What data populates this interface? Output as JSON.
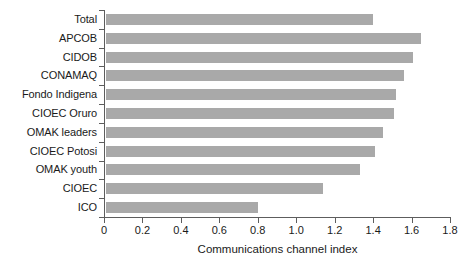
{
  "chart_data": {
    "type": "bar",
    "orientation": "horizontal",
    "title": "",
    "xlabel": "Communications channel index",
    "ylabel": "",
    "categories": [
      "Total",
      "APCOB",
      "CIDOB",
      "CONAMAQ",
      "Fondo Indigena",
      "CIOEC Oruro",
      "OMAK leaders",
      "CIOEC Potosi",
      "OMAK youth",
      "CIOEC",
      "ICO"
    ],
    "values": [
      1.4,
      1.65,
      1.61,
      1.56,
      1.52,
      1.51,
      1.45,
      1.41,
      1.33,
      1.14,
      0.8
    ],
    "xlim": [
      0,
      1.8
    ],
    "xticks": [
      0,
      0.2,
      0.4,
      0.6,
      0.8,
      1.0,
      1.2,
      1.4,
      1.6,
      1.8
    ],
    "xtick_labels": [
      "0",
      "0.2",
      "0.4",
      "0.6",
      "0.8",
      "1.0",
      "1.2",
      "1.4",
      "1.6",
      "1.8"
    ],
    "grid": false,
    "legend": null,
    "bar_color": "#a9a9a9",
    "axis_color": "#5d5d5d"
  }
}
